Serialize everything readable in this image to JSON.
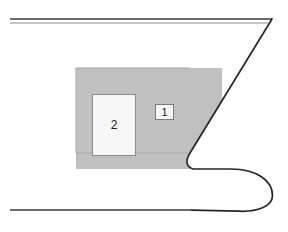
{
  "figure": {
    "background_color": "#ffffff",
    "width": 288,
    "height": 232,
    "colors": {
      "outline": "#262626",
      "shaded_region": "#c0c0c0",
      "shaded_region_edge": "#a8a8a8",
      "label_fill": "#f7f7f7",
      "label_border": "#7a7a7a",
      "label_text": "#1a1a1a",
      "clipped_text": "#d9d9d9"
    },
    "callouts": [
      {
        "id": "callout-1",
        "label": "1",
        "shape": "small-box",
        "x": 155,
        "y": 104,
        "width": 19,
        "height": 16
      },
      {
        "id": "callout-2",
        "label": "2",
        "shape": "large-box",
        "x": 92,
        "y": 94,
        "width": 44,
        "height": 62
      }
    ],
    "clipped_text": {
      "top": "",
      "bottom": ""
    },
    "geometry": {
      "top_line_upper": {
        "x1": 10,
        "y1": 19,
        "x2": 272,
        "y2": 19,
        "stroke": "#3a3a3a",
        "width": 1.6
      },
      "top_line_lower": {
        "x1": 10,
        "y1": 23,
        "x2": 268,
        "y2": 23,
        "stroke": "#8c8c8c",
        "width": 1.2
      },
      "bottom_line": {
        "x1": 10,
        "y1": 210,
        "x2": 192,
        "y2": 210,
        "stroke": "#3a3a3a",
        "width": 1.6
      },
      "shaded_rect": {
        "x": 76,
        "y": 68,
        "width": 114,
        "height": 85
      },
      "hook_path": "M 272 19 L 190 153 C 186 160 186 166 192 169 L 232 169 C 258 169 272 182 272 196 C 272 207 258 212 240 211 L 192 210",
      "shaded_fill_path": "M 76 68 L 222 68 L 190 153 C 186 160 186 166 192 169 L 76 169 Z"
    }
  }
}
